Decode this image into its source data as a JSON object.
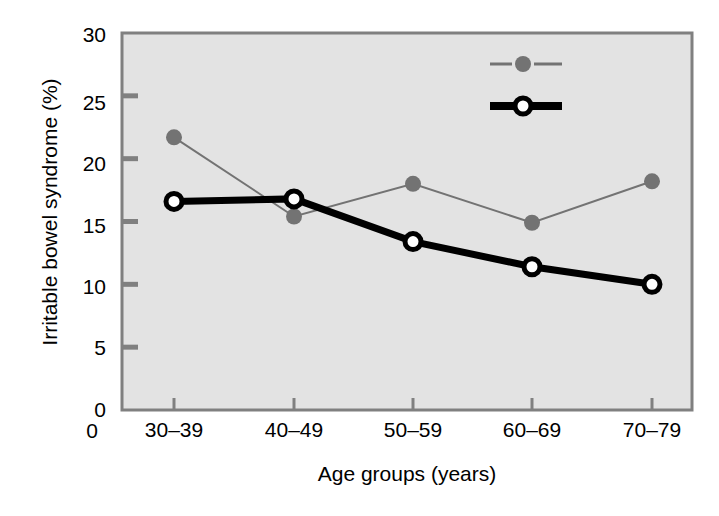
{
  "chart_data": {
    "type": "line",
    "title": "",
    "xlabel": "Age groups (years)",
    "ylabel": "Irritable bowel syndrome (%)",
    "categories": [
      "30–39",
      "40–49",
      "50–59",
      "60–69",
      "70–79"
    ],
    "ytick_labels": [
      "0",
      "5",
      "10",
      "15",
      "20",
      "25",
      "30"
    ],
    "ytick_values": [
      0,
      5,
      10,
      15,
      20,
      25,
      30
    ],
    "ylim": [
      0,
      30
    ],
    "grid": false,
    "legend_position": "top-right inside plot area",
    "series": [
      {
        "name": "Females",
        "values": [
          21.7,
          15.4,
          18.0,
          14.9,
          18.2
        ],
        "color": "#737373",
        "line_width": 2,
        "marker": "filled-circle"
      },
      {
        "name": "Males",
        "values": [
          16.6,
          16.8,
          13.4,
          11.4,
          10.0
        ],
        "color": "#000000",
        "line_width": 7,
        "marker": "open-circle"
      }
    ]
  },
  "plot": {
    "background_color": "#e3e3e3",
    "border_color": "#808080",
    "page_background": "#ffffff"
  },
  "legend": {
    "items": [
      {
        "label": "Females"
      },
      {
        "label": "Males"
      }
    ]
  }
}
